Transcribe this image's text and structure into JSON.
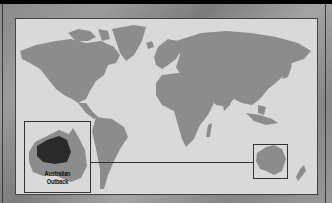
{
  "scene": "world-map-mission-select",
  "map": {
    "background_color": "#d9d9d9",
    "land_color": "#8c8c8c",
    "highlight_color": "#2a2a2a"
  },
  "inset": {
    "title_line1": "Australian",
    "title_line2": "Outback"
  }
}
